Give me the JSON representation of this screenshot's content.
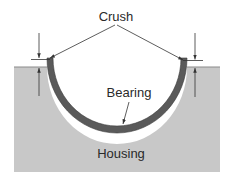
{
  "diagram": {
    "labels": {
      "crush": "Crush",
      "bearing": "Bearing",
      "housing": "Housing"
    },
    "colors": {
      "background": "#ffffff",
      "housing_fill": "#c8c8c8",
      "housing_edge": "#8a8a8a",
      "bearing_shell": "#5a5a5a",
      "lines": "#333333",
      "text": "#2a2a2a"
    },
    "components": [
      {
        "name": "housing",
        "description": "Gray housing block with semicircular bore"
      },
      {
        "name": "bearing-shell",
        "description": "Dark half-shell bearing seated in bore, protruding above housing parting line"
      },
      {
        "name": "crush-indicator-left",
        "description": "Opposed arrows showing crush height on left"
      },
      {
        "name": "crush-indicator-right",
        "description": "Opposed arrows showing crush height on right"
      }
    ]
  }
}
